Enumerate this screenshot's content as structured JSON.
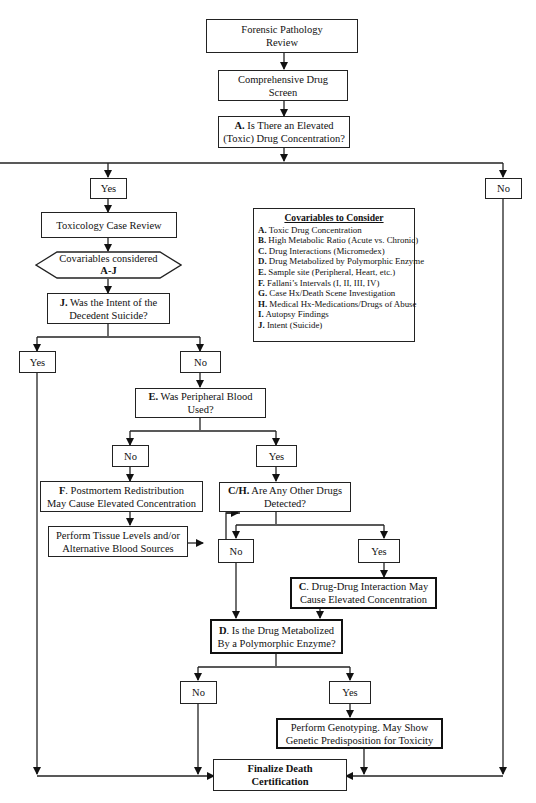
{
  "diagram": {
    "type": "flowchart",
    "nodes": {
      "forensic_review": {
        "line1": "Forensic Pathology",
        "line2": "Review"
      },
      "drug_screen": {
        "line1": "Comprehensive Drug",
        "line2": "Screen"
      },
      "q_a": {
        "prefix": "A.",
        "line1": " Is There an Elevated",
        "line2": "(Toxic) Drug Concentration?"
      },
      "a_yes": "Yes",
      "a_no": "No",
      "tox_review": "Toxicology Case Review",
      "covariables": {
        "line1": "Covariables considered",
        "line2": "A-J"
      },
      "q_j": {
        "prefix": "J.",
        "line1": " Was the Intent of the",
        "line2": "Decedent Suicide?"
      },
      "j_yes": "Yes",
      "j_no": "No",
      "q_e": {
        "prefix": "E.",
        "line1": " Was Peripheral Blood",
        "line2": "Used?"
      },
      "e_no": "No",
      "e_yes": "Yes",
      "f_box": {
        "prefix": "F",
        "line1": ". Postmortem Redistribution",
        "line2": "May Cause Elevated Concentration"
      },
      "tissue": {
        "line1": "Perform Tissue Levels and/or",
        "line2": "Alternative Blood Sources"
      },
      "q_ch": {
        "prefix": "C/H.",
        "line1": " Are Any Other Drugs",
        "line2": "Detected?"
      },
      "ch_no": "No",
      "ch_yes": "Yes",
      "c_box": {
        "prefix": "C",
        "line1": ". Drug-Drug Interaction May",
        "line2": "Cause Elevated Concentration"
      },
      "q_d": {
        "prefix": "D",
        "line1": ". Is the Drug Metabolized",
        "line2": "By a Polymorphic Enzyme?"
      },
      "d_no": "No",
      "d_yes": "Yes",
      "genotyping": {
        "line1": "Perform Genotyping. May Show",
        "line2": "Genetic Predisposition for Toxicity"
      },
      "finalize": {
        "line1": "Finalize Death",
        "line2": "Certification"
      }
    },
    "legend": {
      "title": "Covariables to Consider",
      "items": [
        {
          "key": "A.",
          "text": " Toxic Drug Concentration"
        },
        {
          "key": "B.",
          "text": " High Metabolic Ratio (Acute vs. Chronic)"
        },
        {
          "key": "C.",
          "text": " Drug Interactions (Micromedex)"
        },
        {
          "key": "D.",
          "text": " Drug Metabolized by Polymorphic Enzyme"
        },
        {
          "key": "E.",
          "text": " Sample site (Peripheral, Heart, etc.)"
        },
        {
          "key": "F.",
          "text": " Fallani’s Intervals (I, II, III, IV)"
        },
        {
          "key": "G.",
          "text": " Case Hx/Death Scene Investigation"
        },
        {
          "key": "H.",
          "text": " Medical Hx-Medications/Drugs of Abuse"
        },
        {
          "key": "I.",
          "text": "  Autopsy Findings"
        },
        {
          "key": "J.",
          "text": " Intent (Suicide)"
        }
      ]
    },
    "colors": {
      "line": "#222222",
      "background": "#ffffff"
    }
  }
}
